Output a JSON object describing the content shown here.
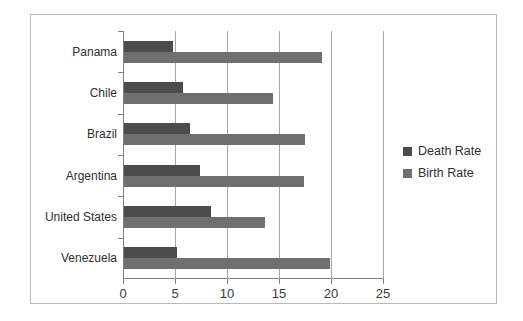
{
  "chart_data": {
    "type": "bar",
    "orientation": "horizontal",
    "title": "",
    "xlabel": "",
    "ylabel": "",
    "xlim": [
      0,
      25
    ],
    "xticks": [
      0,
      5,
      10,
      15,
      20,
      25
    ],
    "xtick_labels": [
      "0",
      "5",
      "10",
      "15",
      "20",
      "25"
    ],
    "grid": true,
    "grid_axis": "x",
    "legend_position": "right",
    "categories": [
      "Panama",
      "Chile",
      "Brazil",
      "Argentina",
      "United States",
      "Venezuela"
    ],
    "series": [
      {
        "name": "Death Rate",
        "color": "#4c4c4c",
        "values": [
          4.8,
          5.8,
          6.4,
          7.4,
          8.5,
          5.2
        ]
      },
      {
        "name": "Birth Rate",
        "color": "#6f6f6f",
        "values": [
          19.1,
          14.4,
          17.5,
          17.4,
          13.7,
          19.9
        ]
      }
    ]
  },
  "legend": {
    "entries": [
      {
        "label": "Death Rate",
        "color": "#4c4c4c"
      },
      {
        "label": "Birth Rate",
        "color": "#6f6f6f"
      }
    ]
  },
  "frame": {
    "border_color": "#b9b9b9",
    "background": "#ffffff"
  },
  "axis": {
    "line_color": "#7f7f7f",
    "grid_color": "#a6a6a6"
  }
}
